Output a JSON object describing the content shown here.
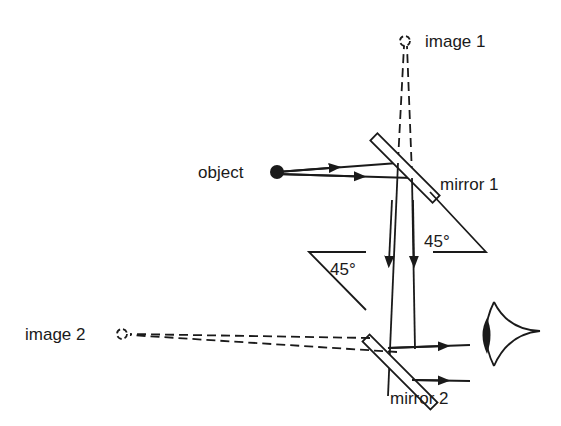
{
  "diagram": {
    "labels": {
      "object": "object",
      "image1": "image 1",
      "image2": "image 2",
      "mirror1": "mirror 1",
      "mirror2": "mirror 2",
      "angle1": "45°",
      "angle2": "45°"
    },
    "colors": {
      "ink": "#1a1a1a",
      "background": "#ffffff"
    },
    "elements": [
      {
        "id": "object",
        "type": "point",
        "style": "filled"
      },
      {
        "id": "image-1",
        "type": "point",
        "style": "dashed-circle"
      },
      {
        "id": "image-2",
        "type": "point",
        "style": "dashed-circle"
      },
      {
        "id": "mirror-1",
        "type": "plane-mirror",
        "angle": "45°"
      },
      {
        "id": "mirror-2",
        "type": "plane-mirror",
        "angle": "45°"
      },
      {
        "id": "eye",
        "type": "observer"
      }
    ]
  }
}
